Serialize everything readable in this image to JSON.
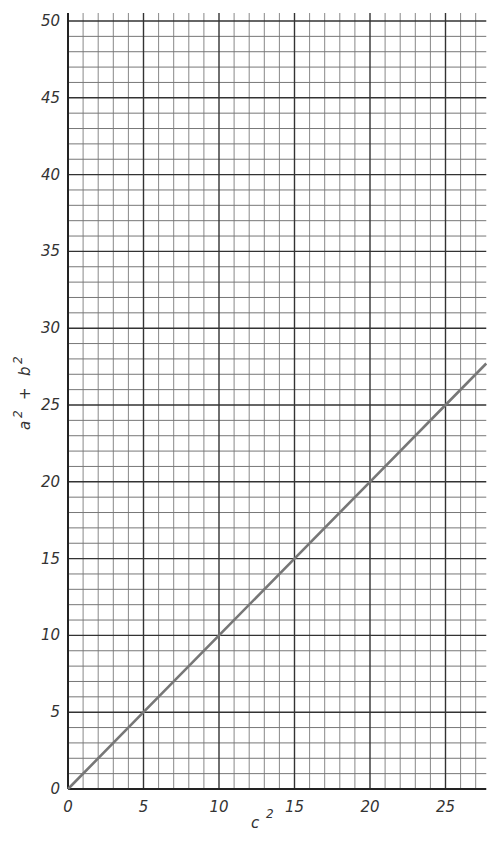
{
  "chart_data": {
    "type": "line",
    "title": "",
    "xlabel": "c 2",
    "ylabel": "a 2 + b 2",
    "xlim": [
      0,
      27.7
    ],
    "ylim": [
      0,
      50
    ],
    "x_ticks": [
      0,
      5,
      10,
      15,
      20,
      25
    ],
    "y_ticks": [
      0,
      5,
      10,
      15,
      20,
      25,
      30,
      35,
      40,
      45,
      50
    ],
    "grid": true,
    "minor_grid_step": 1,
    "major_grid_step": 5,
    "series": [
      {
        "name": "a^2 + b^2 = c^2",
        "x": [
          0,
          5,
          10,
          15,
          20,
          25,
          27.7
        ],
        "y": [
          0,
          5,
          10,
          15,
          20,
          25,
          27.7
        ],
        "color": "#777777"
      }
    ],
    "legend": null
  },
  "labels": {
    "x_axis": "c",
    "x_axis_sup": "2",
    "y_axis_a": "a",
    "y_axis_plus": "+",
    "y_axis_b": "b",
    "y_axis_sup": "2"
  }
}
